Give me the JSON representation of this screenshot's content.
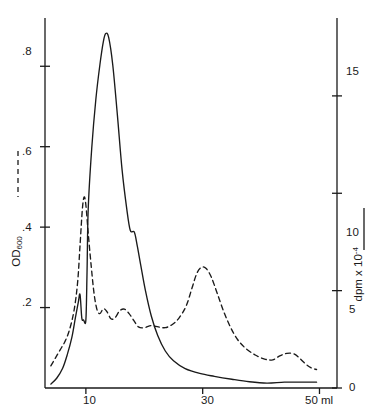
{
  "chart_data": {
    "type": "line",
    "title": "",
    "xlabel": "ml",
    "x_unit": "ml",
    "xlim": [
      3,
      53
    ],
    "x_ticks": [
      10,
      30,
      50
    ],
    "x_tick_labels": [
      "10",
      "30",
      "50 ml"
    ],
    "grid": false,
    "legend_position": "axis-titles",
    "axes": [
      {
        "id": "left",
        "label_text": "OD",
        "label_subscript": "600",
        "label_full": "OD600",
        "line_style": "dashed",
        "ylim": [
          0,
          0.92
        ],
        "ticks": [
          0.2,
          0.4,
          0.6,
          0.8
        ],
        "tick_labels": [
          ".2",
          ".4",
          ".6",
          ".8"
        ]
      },
      {
        "id": "right",
        "label_text": "dpm x 10",
        "label_superscript": "-4",
        "label_full": "dpm x 10-4",
        "line_style": "solid",
        "ylim": [
          0,
          19
        ],
        "ticks": [
          0,
          5,
          10,
          15
        ],
        "tick_labels": [
          "0",
          "5",
          "10",
          "15"
        ]
      }
    ],
    "series": [
      {
        "name": "dpm x 10-4",
        "axis": "right",
        "style": "solid",
        "color": "#1a1a1a",
        "points": [
          [
            4.0,
            0.2
          ],
          [
            5.0,
            0.5
          ],
          [
            6.0,
            1.0
          ],
          [
            6.8,
            1.7
          ],
          [
            7.6,
            2.6
          ],
          [
            8.2,
            3.6
          ],
          [
            8.7,
            4.4
          ],
          [
            9.0,
            4.8
          ],
          [
            9.3,
            3.6
          ],
          [
            9.6,
            3.5
          ],
          [
            10.0,
            3.5
          ],
          [
            10.2,
            6.0
          ],
          [
            10.4,
            9.2
          ],
          [
            11.0,
            12.3
          ],
          [
            11.7,
            14.8
          ],
          [
            12.4,
            16.6
          ],
          [
            13.0,
            17.8
          ],
          [
            13.4,
            18.2
          ],
          [
            13.9,
            18.0
          ],
          [
            14.6,
            16.6
          ],
          [
            15.4,
            14.0
          ],
          [
            16.2,
            11.2
          ],
          [
            17.0,
            9.2
          ],
          [
            17.6,
            8.1
          ],
          [
            18.3,
            8.0
          ],
          [
            18.8,
            7.3
          ],
          [
            19.4,
            6.3
          ],
          [
            20.2,
            5.0
          ],
          [
            21.2,
            3.7
          ],
          [
            22.3,
            2.7
          ],
          [
            23.6,
            1.9
          ],
          [
            25.0,
            1.4
          ],
          [
            27.0,
            1.0
          ],
          [
            29.5,
            0.75
          ],
          [
            32.0,
            0.6
          ],
          [
            35.0,
            0.45
          ],
          [
            38.0,
            0.32
          ],
          [
            41.0,
            0.25
          ],
          [
            44.0,
            0.3
          ],
          [
            47.0,
            0.3
          ],
          [
            49.5,
            0.3
          ]
        ]
      },
      {
        "name": "OD600",
        "axis": "left",
        "style": "dashed",
        "color": "#1a1a1a",
        "points": [
          [
            4.0,
            0.055
          ],
          [
            4.8,
            0.075
          ],
          [
            5.6,
            0.095
          ],
          [
            6.4,
            0.115
          ],
          [
            7.2,
            0.145
          ],
          [
            8.0,
            0.195
          ],
          [
            8.6,
            0.265
          ],
          [
            9.0,
            0.355
          ],
          [
            9.4,
            0.445
          ],
          [
            9.7,
            0.475
          ],
          [
            10.0,
            0.455
          ],
          [
            10.4,
            0.385
          ],
          [
            10.9,
            0.305
          ],
          [
            11.4,
            0.235
          ],
          [
            11.9,
            0.195
          ],
          [
            12.4,
            0.185
          ],
          [
            13.0,
            0.197
          ],
          [
            13.6,
            0.19
          ],
          [
            14.3,
            0.172
          ],
          [
            15.0,
            0.175
          ],
          [
            15.8,
            0.192
          ],
          [
            16.6,
            0.196
          ],
          [
            17.4,
            0.185
          ],
          [
            18.2,
            0.168
          ],
          [
            19.0,
            0.152
          ],
          [
            20.0,
            0.15
          ],
          [
            21.2,
            0.155
          ],
          [
            22.4,
            0.152
          ],
          [
            23.6,
            0.15
          ],
          [
            24.8,
            0.158
          ],
          [
            26.0,
            0.175
          ],
          [
            27.2,
            0.205
          ],
          [
            28.2,
            0.25
          ],
          [
            29.0,
            0.285
          ],
          [
            29.8,
            0.3
          ],
          [
            30.6,
            0.297
          ],
          [
            31.5,
            0.275
          ],
          [
            32.5,
            0.235
          ],
          [
            33.6,
            0.19
          ],
          [
            34.8,
            0.15
          ],
          [
            36.0,
            0.12
          ],
          [
            37.4,
            0.098
          ],
          [
            39.0,
            0.082
          ],
          [
            40.6,
            0.072
          ],
          [
            42.0,
            0.07
          ],
          [
            43.2,
            0.08
          ],
          [
            44.4,
            0.086
          ],
          [
            45.6,
            0.085
          ],
          [
            46.6,
            0.074
          ],
          [
            47.6,
            0.06
          ],
          [
            48.6,
            0.05
          ],
          [
            49.5,
            0.046
          ]
        ]
      }
    ]
  },
  "labels": {
    "y_left_ticks": [
      ".8",
      ".6",
      ".4",
      ".2"
    ],
    "y_right_ticks": [
      "15",
      "10",
      "5",
      "0"
    ],
    "x_ticks": [
      "10",
      "30",
      "50 ml"
    ],
    "left_axis_title_main": "OD",
    "left_axis_title_sub": "600",
    "right_axis_title_main": "dpm x 10",
    "right_axis_title_sup": "-4"
  }
}
